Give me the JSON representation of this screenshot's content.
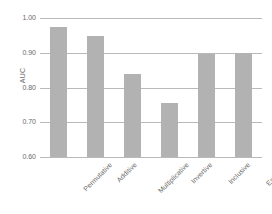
{
  "chart_data": {
    "type": "bar",
    "title": "",
    "xlabel": "",
    "ylabel": "AUC",
    "categories": [
      "Permutative",
      "Additive",
      "Multiplicative",
      "Invertive",
      "Inclusive",
      "Exclusive"
    ],
    "values": [
      0.974,
      0.947,
      0.839,
      0.755,
      0.896,
      0.9
    ],
    "ylim": [
      0.6,
      1.0
    ],
    "yticks": [
      "0.60",
      "0.70",
      "0.80",
      "0.90",
      "1.00"
    ],
    "ytick_values": [
      0.6,
      0.7,
      0.8,
      0.9,
      1.0
    ],
    "grid": true,
    "legend": "none",
    "bar_color": "#b2b2b2",
    "gridline_color": "#b9b9b9",
    "text_color": "#6a6a6a",
    "background": "#ffffff"
  }
}
